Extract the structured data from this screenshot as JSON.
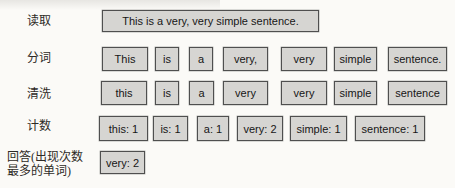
{
  "diagram": {
    "colors": {
      "background": "#fbfaf7",
      "box_fill": "#d6d5d2",
      "box_border": "#4f4f4f",
      "box_text": "#161616",
      "label_text": "#2e2a26"
    },
    "rows": [
      {
        "name": "read",
        "label": "读取",
        "label_x": 27,
        "label_y": 14,
        "label_w": 60,
        "y": 10,
        "h": 22,
        "boxes": [
          {
            "text": "This is a very, very simple sentence.",
            "x": 102,
            "w": 217
          }
        ]
      },
      {
        "name": "tokenize",
        "label": "分词",
        "label_x": 27,
        "label_y": 51,
        "label_w": 60,
        "y": 47,
        "h": 24,
        "boxes": [
          {
            "text": "This",
            "x": 102,
            "w": 46
          },
          {
            "text": "is",
            "x": 155,
            "w": 24
          },
          {
            "text": "a",
            "x": 189,
            "w": 24
          },
          {
            "text": "very,",
            "x": 223,
            "w": 45
          },
          {
            "text": "very",
            "x": 281,
            "w": 46
          },
          {
            "text": "simple",
            "x": 334,
            "w": 43
          },
          {
            "text": "sentence.",
            "x": 388,
            "w": 59
          }
        ]
      },
      {
        "name": "clean",
        "label": "清洗",
        "label_x": 27,
        "label_y": 87,
        "label_w": 60,
        "y": 81,
        "h": 24,
        "boxes": [
          {
            "text": "this",
            "x": 101,
            "w": 46
          },
          {
            "text": "is",
            "x": 155,
            "w": 24
          },
          {
            "text": "a",
            "x": 189,
            "w": 25
          },
          {
            "text": "very",
            "x": 223,
            "w": 45
          },
          {
            "text": "very",
            "x": 281,
            "w": 46
          },
          {
            "text": "simple",
            "x": 334,
            "w": 43
          },
          {
            "text": "sentence",
            "x": 388,
            "w": 59
          }
        ]
      },
      {
        "name": "count",
        "label": "计数",
        "label_x": 27,
        "label_y": 119,
        "label_w": 60,
        "y": 116,
        "h": 25,
        "boxes": [
          {
            "text": "this: 1",
            "x": 99,
            "w": 49
          },
          {
            "text": "is: 1",
            "x": 153,
            "w": 35
          },
          {
            "text": "a: 1",
            "x": 197,
            "w": 32
          },
          {
            "text": "very: 2",
            "x": 237,
            "w": 46
          },
          {
            "text": "simple: 1",
            "x": 290,
            "w": 57
          },
          {
            "text": "sentence: 1",
            "x": 355,
            "w": 70
          }
        ]
      },
      {
        "name": "answer",
        "label": "回答(出现次数\n最多的单词)",
        "label_x": 7,
        "label_y": 150,
        "label_w": 88,
        "y": 151,
        "h": 23,
        "boxes": [
          {
            "text": "very: 2",
            "x": 100,
            "w": 45
          }
        ]
      }
    ]
  }
}
